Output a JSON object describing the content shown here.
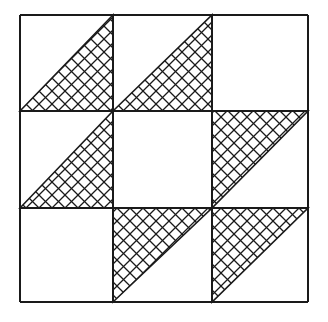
{
  "diagram": {
    "stroke_color": "#1a1a1a",
    "background": "#ffffff",
    "grid": {
      "rows": 3,
      "cols": 3,
      "col_lines": [
        20,
        113,
        212,
        308
      ],
      "row_lines": [
        15,
        111,
        208,
        302
      ]
    },
    "cells": [
      {
        "row": 0,
        "col": 0,
        "triangle": "lower-right"
      },
      {
        "row": 0,
        "col": 1,
        "triangle": "lower-right"
      },
      {
        "row": 0,
        "col": 2,
        "triangle": "none"
      },
      {
        "row": 1,
        "col": 0,
        "triangle": "lower-right"
      },
      {
        "row": 1,
        "col": 1,
        "triangle": "none"
      },
      {
        "row": 1,
        "col": 2,
        "triangle": "upper-left"
      },
      {
        "row": 2,
        "col": 0,
        "triangle": "none"
      },
      {
        "row": 2,
        "col": 1,
        "triangle": "upper-left"
      },
      {
        "row": 2,
        "col": 2,
        "triangle": "upper-left"
      }
    ]
  }
}
